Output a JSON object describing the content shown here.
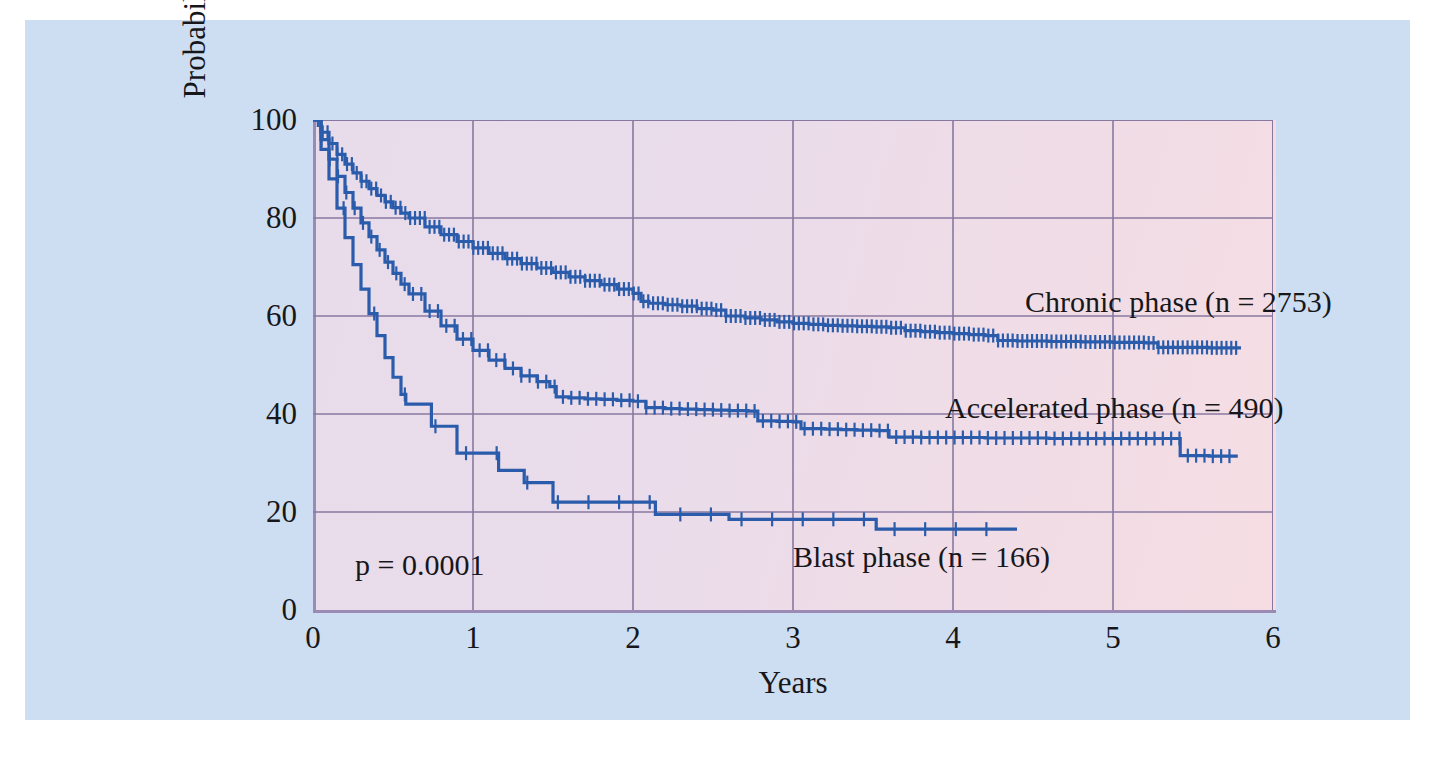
{
  "figure": {
    "background_color": "#cddef2",
    "plot_background_colors": [
      "#e9dcea",
      "#f6dde3"
    ],
    "grid_color": "#8878a0",
    "curve_color": "#2a5cab",
    "axis_color": "#9b8ab4"
  },
  "chart_data": {
    "type": "line",
    "title": "",
    "subtitle": "",
    "xlabel": "Years",
    "ylabel": "Probability of LFS (%)",
    "xlim": [
      0,
      6
    ],
    "ylim": [
      0,
      100
    ],
    "xticks": [
      0,
      1,
      2,
      3,
      4,
      5,
      6
    ],
    "xtick_labels": [
      "0",
      "1",
      "2",
      "3",
      "4",
      "5",
      "6"
    ],
    "yticks": [
      0,
      20,
      40,
      60,
      80,
      100
    ],
    "ytick_labels": [
      "0",
      "20",
      "40",
      "60",
      "80",
      "100"
    ],
    "grid": true,
    "legend_position": "inline-annotations",
    "annotations": [
      {
        "text": "p = 0.0001",
        "x": 0.28,
        "y": 8
      },
      {
        "text": "Chronic phase (n = 2753)",
        "x": 4.45,
        "y": 61
      },
      {
        "text": "Accelerated phase (n = 490)",
        "x": 3.95,
        "y": 40
      },
      {
        "text": "Blast phase (n = 166)",
        "x": 3.0,
        "y": 11
      }
    ],
    "series": [
      {
        "name": "Chronic phase (n = 2753)",
        "label": "Chronic phase (n = 2753)",
        "n": 2753,
        "color": "#2a5cab",
        "points": [
          [
            0.0,
            100.0
          ],
          [
            0.05,
            97.5
          ],
          [
            0.1,
            95.2
          ],
          [
            0.15,
            93.0
          ],
          [
            0.2,
            91.0
          ],
          [
            0.25,
            89.2
          ],
          [
            0.3,
            87.5
          ],
          [
            0.35,
            86.0
          ],
          [
            0.4,
            84.6
          ],
          [
            0.45,
            83.3
          ],
          [
            0.5,
            82.1
          ],
          [
            0.55,
            81.0
          ],
          [
            0.6,
            80.0
          ],
          [
            0.7,
            78.2
          ],
          [
            0.8,
            76.6
          ],
          [
            0.9,
            75.2
          ],
          [
            1.0,
            73.9
          ],
          [
            1.1,
            72.8
          ],
          [
            1.2,
            71.7
          ],
          [
            1.3,
            70.7
          ],
          [
            1.4,
            69.8
          ],
          [
            1.5,
            68.9
          ],
          [
            1.6,
            68.0
          ],
          [
            1.7,
            67.2
          ],
          [
            1.8,
            66.4
          ],
          [
            1.9,
            65.5
          ],
          [
            2.0,
            64.6
          ],
          [
            2.05,
            63.0
          ],
          [
            2.1,
            62.6
          ],
          [
            2.2,
            62.3
          ],
          [
            2.3,
            62.0
          ],
          [
            2.4,
            61.5
          ],
          [
            2.5,
            61.2
          ],
          [
            2.58,
            60.0
          ],
          [
            2.7,
            59.6
          ],
          [
            2.8,
            59.2
          ],
          [
            2.9,
            58.8
          ],
          [
            3.0,
            58.5
          ],
          [
            3.1,
            58.3
          ],
          [
            3.2,
            58.1
          ],
          [
            3.3,
            58.0
          ],
          [
            3.4,
            57.9
          ],
          [
            3.5,
            57.8
          ],
          [
            3.6,
            57.6
          ],
          [
            3.7,
            57.0
          ],
          [
            3.8,
            56.8
          ],
          [
            3.9,
            56.6
          ],
          [
            4.0,
            56.4
          ],
          [
            4.1,
            56.2
          ],
          [
            4.2,
            56.0
          ],
          [
            4.28,
            55.0
          ],
          [
            4.4,
            54.9
          ],
          [
            4.6,
            54.8
          ],
          [
            4.8,
            54.7
          ],
          [
            5.0,
            54.6
          ],
          [
            5.2,
            54.5
          ],
          [
            5.28,
            53.6
          ],
          [
            5.4,
            53.6
          ],
          [
            5.6,
            53.5
          ],
          [
            5.8,
            53.5
          ]
        ],
        "final_value": 53.5,
        "final_time": 5.8
      },
      {
        "name": "Accelerated phase (n = 490)",
        "label": "Accelerated phase (n = 490)",
        "n": 490,
        "color": "#2a5cab",
        "points": [
          [
            0.0,
            100.0
          ],
          [
            0.05,
            96.0
          ],
          [
            0.1,
            92.0
          ],
          [
            0.15,
            88.5
          ],
          [
            0.2,
            85.2
          ],
          [
            0.25,
            82.0
          ],
          [
            0.3,
            79.0
          ],
          [
            0.35,
            76.2
          ],
          [
            0.4,
            73.5
          ],
          [
            0.45,
            71.0
          ],
          [
            0.5,
            68.7
          ],
          [
            0.55,
            66.5
          ],
          [
            0.6,
            64.5
          ],
          [
            0.7,
            61.0
          ],
          [
            0.8,
            58.0
          ],
          [
            0.9,
            55.3
          ],
          [
            1.0,
            53.0
          ],
          [
            1.1,
            51.0
          ],
          [
            1.2,
            49.3
          ],
          [
            1.3,
            47.8
          ],
          [
            1.4,
            46.6
          ],
          [
            1.48,
            45.6
          ],
          [
            1.52,
            43.5
          ],
          [
            1.6,
            43.3
          ],
          [
            1.7,
            43.1
          ],
          [
            1.8,
            43.0
          ],
          [
            1.9,
            42.8
          ],
          [
            2.0,
            42.6
          ],
          [
            2.08,
            41.3
          ],
          [
            2.2,
            41.1
          ],
          [
            2.3,
            41.0
          ],
          [
            2.4,
            40.9
          ],
          [
            2.5,
            40.8
          ],
          [
            2.6,
            40.7
          ],
          [
            2.72,
            40.6
          ],
          [
            2.78,
            38.6
          ],
          [
            2.9,
            38.5
          ],
          [
            3.0,
            38.4
          ],
          [
            3.05,
            37.0
          ],
          [
            3.2,
            36.9
          ],
          [
            3.3,
            36.8
          ],
          [
            3.4,
            36.7
          ],
          [
            3.52,
            36.6
          ],
          [
            3.6,
            35.3
          ],
          [
            3.8,
            35.2
          ],
          [
            4.0,
            35.2
          ],
          [
            4.2,
            35.1
          ],
          [
            4.4,
            35.1
          ],
          [
            4.6,
            35.0
          ],
          [
            4.8,
            35.0
          ],
          [
            5.0,
            35.0
          ],
          [
            5.2,
            35.0
          ],
          [
            5.35,
            35.0
          ],
          [
            5.42,
            31.5
          ],
          [
            5.6,
            31.4
          ],
          [
            5.78,
            31.4
          ]
        ],
        "final_value": 31.4,
        "final_time": 5.78
      },
      {
        "name": "Blast phase (n = 166)",
        "label": "Blast phase (n = 166)",
        "n": 166,
        "color": "#2a5cab",
        "points": [
          [
            0.0,
            100.0
          ],
          [
            0.05,
            94.0
          ],
          [
            0.1,
            88.0
          ],
          [
            0.15,
            82.0
          ],
          [
            0.2,
            76.0
          ],
          [
            0.25,
            70.5
          ],
          [
            0.3,
            65.5
          ],
          [
            0.35,
            60.5
          ],
          [
            0.4,
            56.0
          ],
          [
            0.45,
            51.5
          ],
          [
            0.5,
            47.5
          ],
          [
            0.55,
            44.0
          ],
          [
            0.58,
            42.0
          ],
          [
            0.7,
            42.0
          ],
          [
            0.74,
            37.5
          ],
          [
            0.86,
            37.5
          ],
          [
            0.9,
            32.0
          ],
          [
            1.12,
            32.0
          ],
          [
            1.16,
            28.5
          ],
          [
            1.28,
            28.5
          ],
          [
            1.32,
            26.0
          ],
          [
            1.47,
            26.0
          ],
          [
            1.5,
            22.0
          ],
          [
            2.1,
            22.0
          ],
          [
            2.14,
            19.5
          ],
          [
            2.56,
            19.5
          ],
          [
            2.6,
            18.5
          ],
          [
            3.48,
            18.5
          ],
          [
            3.52,
            16.5
          ],
          [
            4.0,
            16.5
          ],
          [
            4.4,
            16.5
          ]
        ],
        "final_value": 16.5,
        "final_time": 4.4
      }
    ]
  }
}
